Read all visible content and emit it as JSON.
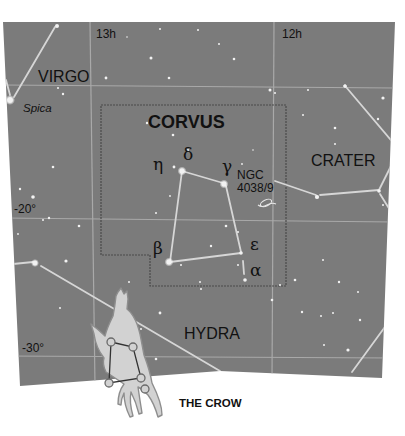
{
  "map": {
    "title": "CORVUS",
    "background_color": "#7b7b7b",
    "grid_color": "#a9a9a9",
    "boundary_color": "#4a4a4a",
    "stick_color": "#d6d6d6",
    "ra_labels": [
      {
        "text": "13h",
        "x": 96,
        "y": 38
      },
      {
        "text": "12h",
        "x": 282,
        "y": 38
      }
    ],
    "dec_labels": [
      {
        "text": "-20°",
        "x": 14,
        "y": 213
      },
      {
        "text": "-30°",
        "x": 22,
        "y": 352
      }
    ],
    "constellations": [
      {
        "text": "VIRGO",
        "x": 38,
        "y": 82,
        "size": 16,
        "bold": false
      },
      {
        "text": "CORVUS",
        "x": 148,
        "y": 128,
        "size": 18,
        "bold": true
      },
      {
        "text": "CRATER",
        "x": 311,
        "y": 166,
        "size": 16,
        "bold": false
      },
      {
        "text": "HYDRA",
        "x": 184,
        "y": 339,
        "size": 16,
        "bold": false
      }
    ],
    "star_names": [
      {
        "text": "Spica",
        "x": 23,
        "y": 112
      }
    ],
    "greek_letters": [
      {
        "text": "η",
        "x": 153,
        "y": 170
      },
      {
        "text": "δ",
        "x": 183,
        "y": 160
      },
      {
        "text": "γ",
        "x": 222,
        "y": 172
      },
      {
        "text": "β",
        "x": 153,
        "y": 254
      },
      {
        "text": "ε",
        "x": 250,
        "y": 250
      },
      {
        "text": "α",
        "x": 250,
        "y": 276
      }
    ],
    "deep_sky": {
      "line1": "NGC",
      "line2": "4038/9"
    },
    "inset_caption": "THE CROW"
  }
}
